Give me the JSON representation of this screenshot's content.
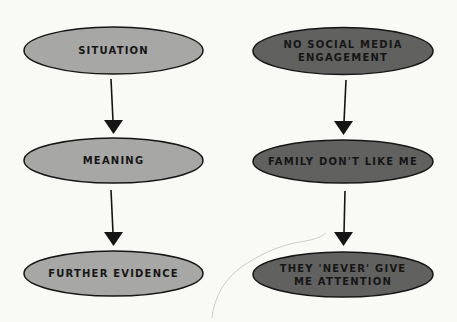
{
  "colors": {
    "background": "#f9f9f6",
    "light_node_fill": "#a7a7a5",
    "dark_node_fill": "#616160",
    "stroke": "#151515",
    "text": "#161616",
    "faint_curve": "#c8c8c8"
  },
  "columns": [
    {
      "name": "generic-model",
      "nodes": [
        {
          "label": "SITUATION"
        },
        {
          "label": "MEANING"
        },
        {
          "label": "FURTHER EVIDENCE"
        }
      ]
    },
    {
      "name": "example",
      "nodes": [
        {
          "label": "NO SOCIAL MEDIA\nENGAGEMENT"
        },
        {
          "label": "FAMILY DON'T LIKE ME"
        },
        {
          "label": "THEY 'NEVER' GIVE\nME ATTENTION"
        }
      ]
    }
  ]
}
